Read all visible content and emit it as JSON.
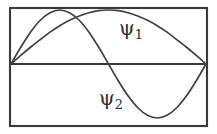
{
  "figure": {
    "background_color": "#ffffff",
    "frame": {
      "stroke_color": "#3a3a3a",
      "x": 10,
      "y": 8,
      "width": 197,
      "height": 118
    },
    "axis": {
      "label": "zero-axis",
      "stroke_color": "#3a3a3a",
      "y": 64,
      "x_start": 11,
      "x_end": 206
    },
    "labels": {
      "psi1": {
        "symbol": "ψ",
        "subscript": "1",
        "text": "ψ₁",
        "x": 119,
        "y": 18
      },
      "psi2": {
        "symbol": "ψ",
        "subscript": "2",
        "text": "ψ₂",
        "x": 99,
        "y": 88
      }
    }
  },
  "chart_data": {
    "type": "line",
    "title": "",
    "subtitle": "",
    "xlabel": "",
    "ylabel": "",
    "xlim": [
      0,
      1
    ],
    "ylim": [
      -1,
      1
    ],
    "grid": false,
    "legend_position": "inline-annotation",
    "axis_zero_line": true,
    "annotations": [
      {
        "text": "ψ₁",
        "x": 0.56,
        "y": 0.76
      },
      {
        "text": "ψ₂",
        "x": 0.46,
        "y": -0.45
      }
    ],
    "series": [
      {
        "name": "ψ₁",
        "description": "ground-state half-sine, one antinode, single broad positive hump spanning the full well",
        "color": "#404040",
        "nodes": [
          0.0,
          1.0
        ],
        "antinodes": [
          0.5
        ],
        "x": [
          0.0,
          0.05,
          0.1,
          0.15,
          0.2,
          0.25,
          0.3,
          0.35,
          0.4,
          0.45,
          0.5,
          0.55,
          0.6,
          0.65,
          0.7,
          0.75,
          0.8,
          0.85,
          0.9,
          0.95,
          1.0
        ],
        "values": [
          0.0,
          0.16,
          0.31,
          0.45,
          0.59,
          0.71,
          0.81,
          0.89,
          0.95,
          0.99,
          1.0,
          0.99,
          0.95,
          0.89,
          0.81,
          0.71,
          0.59,
          0.45,
          0.31,
          0.16,
          0.0
        ]
      },
      {
        "name": "ψ₂",
        "description": "first-excited full-sine, two antinodes, positive hump then negative trough with a central node",
        "color": "#404040",
        "nodes": [
          0.0,
          0.5,
          1.0
        ],
        "antinodes": [
          0.25,
          0.75
        ],
        "x": [
          0.0,
          0.05,
          0.1,
          0.15,
          0.2,
          0.25,
          0.3,
          0.35,
          0.4,
          0.45,
          0.5,
          0.55,
          0.6,
          0.65,
          0.7,
          0.75,
          0.8,
          0.85,
          0.9,
          0.95,
          1.0
        ],
        "values": [
          0.0,
          0.31,
          0.59,
          0.81,
          0.95,
          1.0,
          0.95,
          0.81,
          0.59,
          0.31,
          0.0,
          -0.31,
          -0.59,
          -0.81,
          -0.95,
          -1.0,
          -0.95,
          -0.81,
          -0.59,
          -0.31,
          0.0
        ]
      }
    ]
  }
}
